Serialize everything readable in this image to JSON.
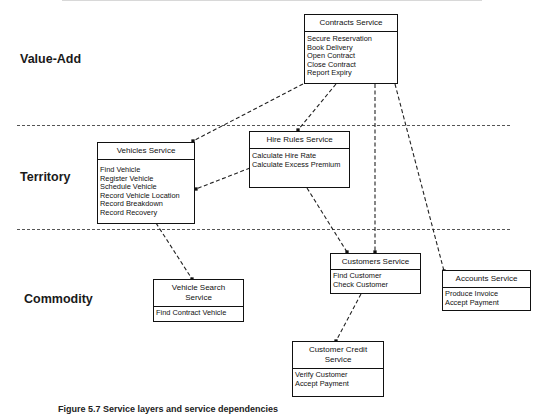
{
  "layers": [
    {
      "id": "value-add",
      "label": "Value-Add"
    },
    {
      "id": "territory",
      "label": "Territory"
    },
    {
      "id": "commodity",
      "label": "Commodity"
    }
  ],
  "services": {
    "contracts": {
      "title": "Contracts Service",
      "operations": [
        "Secure Reservation",
        "Book Delivery",
        "Open Contract",
        "Close Contract",
        "Report Expiry"
      ]
    },
    "vehicles": {
      "title": "Vehicles Service",
      "operations": [
        "Find Vehicle",
        "Register Vehicle",
        "Schedule Vehicle",
        "Record Vehicle Location",
        "Record Breakdown",
        "Record Recovery"
      ]
    },
    "hire_rules": {
      "title": "Hire Rules Service",
      "operations": [
        "Calculate Hire Rate",
        "Calculate Excess Premium"
      ]
    },
    "customers": {
      "title": "Customers Service",
      "operations": [
        "Find Customer",
        "Check Customer"
      ]
    },
    "accounts": {
      "title": "Accounts Service",
      "operations": [
        "Produce Invoice",
        "Accept Payment"
      ]
    },
    "vehicle_search": {
      "title": "Vehicle Search Service",
      "title_lines": [
        "Vehicle Search",
        "Service"
      ],
      "operations": [
        "Find Contract Vehicle"
      ]
    },
    "customer_credit": {
      "title": "Customer Credit Service",
      "title_lines": [
        "Customer Credit",
        "Service"
      ],
      "operations": [
        "Verify Customer",
        "Accept Payment"
      ]
    }
  },
  "dependencies": [
    {
      "from": "contracts",
      "to": "vehicles"
    },
    {
      "from": "contracts",
      "to": "hire_rules"
    },
    {
      "from": "contracts",
      "to": "customers"
    },
    {
      "from": "contracts",
      "to": "accounts"
    },
    {
      "from": "hire_rules",
      "to": "vehicles"
    },
    {
      "from": "hire_rules",
      "to": "customers"
    },
    {
      "from": "vehicles",
      "to": "vehicle_search"
    },
    {
      "from": "customers",
      "to": "customer_credit"
    }
  ],
  "caption": "Figure 5.7  Service layers and service dependencies"
}
